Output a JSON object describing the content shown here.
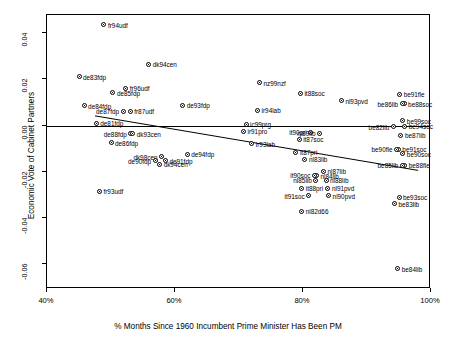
{
  "chart_data": {
    "type": "scatter",
    "title": "",
    "xlabel": "% Months Since 1960 Incumbent Prime Minister Has Been PM",
    "ylabel": "Economic Vote of Cabinet Partners",
    "xlim": [
      40,
      100
    ],
    "ylim": [
      -0.071,
      0.048
    ],
    "xticks": [
      "40%",
      "60%",
      "80%",
      "100%"
    ],
    "xtick_values": [
      40,
      60,
      80,
      100
    ],
    "yticks": [
      "0.04",
      "0.02",
      "0.00",
      "-0.02",
      "-0.04",
      "-0.06"
    ],
    "ytick_values": [
      0.04,
      0.02,
      0.0,
      -0.02,
      -0.04,
      -0.06
    ],
    "grid": false,
    "legend": null,
    "zero_line": 0.0,
    "regression_line": {
      "x0": 47.5,
      "y0": 0.0042,
      "x1": 98.0,
      "y1": -0.0195
    },
    "points": [
      {
        "label": "fr94udf",
        "x": 48.9,
        "y": 0.0437,
        "side": "right"
      },
      {
        "label": "dk94cen",
        "x": 55.9,
        "y": 0.0267,
        "side": "right"
      },
      {
        "label": "de83fdp",
        "x": 45.0,
        "y": 0.0211,
        "side": "right"
      },
      {
        "label": "nz99nzf",
        "x": 73.2,
        "y": 0.0186,
        "side": "right"
      },
      {
        "label": "fr96udf",
        "x": 52.3,
        "y": 0.0161,
        "side": "right"
      },
      {
        "label": "de85fdp",
        "x": 50.3,
        "y": 0.0143,
        "side": "right"
      },
      {
        "label": "it88soc",
        "x": 79.6,
        "y": 0.014,
        "side": "right"
      },
      {
        "label": "be91fle",
        "x": 95.1,
        "y": 0.0135,
        "side": "right"
      },
      {
        "label": "nl93pvd",
        "x": 86.0,
        "y": 0.0107,
        "side": "right"
      },
      {
        "label": "be88soc",
        "x": 95.8,
        "y": 0.0094,
        "side": "right"
      },
      {
        "label": "be86lib",
        "x": 95.5,
        "y": 0.0094,
        "side": "left"
      },
      {
        "label": "de84fdp",
        "x": 45.8,
        "y": 0.0086,
        "side": "right"
      },
      {
        "label": "de93fdp",
        "x": 61.2,
        "y": 0.0088,
        "side": "right"
      },
      {
        "label": "ir94lab",
        "x": 72.9,
        "y": 0.0066,
        "side": "right"
      },
      {
        "label": "fr87udf",
        "x": 53.0,
        "y": 0.0061,
        "side": "right"
      },
      {
        "label": "de87fdp",
        "x": 51.9,
        "y": 0.0061,
        "side": "left"
      },
      {
        "label": "be99soc",
        "x": 95.6,
        "y": 0.0021,
        "side": "right"
      },
      {
        "label": "de81fdp",
        "x": 47.7,
        "y": 0.0009,
        "side": "right"
      },
      {
        "label": "ic99prg",
        "x": 71.1,
        "y": 0.0005,
        "side": "right"
      },
      {
        "label": "be94soc",
        "x": 95.9,
        "y": -0.0003,
        "side": "right"
      },
      {
        "label": "be82lib",
        "x": 94.1,
        "y": -0.0005,
        "side": "left"
      },
      {
        "label": "ir91pro",
        "x": 70.7,
        "y": -0.0025,
        "side": "right"
      },
      {
        "label": "it90pri",
        "x": 81.2,
        "y": -0.0029,
        "side": "left"
      },
      {
        "label": "nl89lib",
        "x": 82.6,
        "y": -0.0034,
        "side": "left"
      },
      {
        "label": "de88fdp",
        "x": 53.1,
        "y": -0.0036,
        "side": "left"
      },
      {
        "label": "dk93cen",
        "x": 53.4,
        "y": -0.0036,
        "side": "right"
      },
      {
        "label": "be87lib",
        "x": 95.3,
        "y": -0.0043,
        "side": "right"
      },
      {
        "label": "it87soc",
        "x": 79.4,
        "y": -0.006,
        "side": "right"
      },
      {
        "label": "de86fdp",
        "x": 50.0,
        "y": -0.0074,
        "side": "right"
      },
      {
        "label": "ir93lab",
        "x": 72.0,
        "y": -0.008,
        "side": "right"
      },
      {
        "label": "be91soc",
        "x": 94.9,
        "y": -0.0104,
        "side": "right"
      },
      {
        "label": "be90fle",
        "x": 94.6,
        "y": -0.0104,
        "side": "left"
      },
      {
        "label": "it87pri",
        "x": 78.9,
        "y": -0.0117,
        "side": "right"
      },
      {
        "label": "be90soc",
        "x": 95.6,
        "y": -0.0122,
        "side": "right"
      },
      {
        "label": "de94fdp",
        "x": 61.9,
        "y": -0.0125,
        "side": "right"
      },
      {
        "label": "dk98cen",
        "x": 57.9,
        "y": -0.0136,
        "side": "left"
      },
      {
        "label": "nl83lib",
        "x": 80.3,
        "y": -0.0147,
        "side": "right"
      },
      {
        "label": "de91fdp",
        "x": 58.5,
        "y": -0.0153,
        "side": "right"
      },
      {
        "label": "de90fdp",
        "x": 56.9,
        "y": -0.0153,
        "side": "left"
      },
      {
        "label": "be88fle",
        "x": 95.9,
        "y": -0.0173,
        "side": "right"
      },
      {
        "label": "be85lib",
        "x": 95.5,
        "y": -0.0173,
        "side": "left"
      },
      {
        "label": "dk94cen",
        "x": 57.6,
        "y": -0.0168,
        "side": "right"
      },
      {
        "label": "nl87lib",
        "x": 83.2,
        "y": -0.0199,
        "side": "right"
      },
      {
        "label": "nl84lib",
        "x": 82.1,
        "y": -0.0219,
        "side": "right"
      },
      {
        "label": "it90soc",
        "x": 81.8,
        "y": -0.0215,
        "side": "left"
      },
      {
        "label": "nl85lib",
        "x": 82.0,
        "y": -0.0238,
        "side": "left"
      },
      {
        "label": "nl88lib",
        "x": 83.6,
        "y": -0.0238,
        "side": "right"
      },
      {
        "label": "it88pri",
        "x": 79.8,
        "y": -0.0272,
        "side": "right"
      },
      {
        "label": "nl91pvd",
        "x": 83.9,
        "y": -0.0272,
        "side": "right"
      },
      {
        "label": "fr93udf",
        "x": 48.2,
        "y": -0.0286,
        "side": "right"
      },
      {
        "label": "it91soc",
        "x": 80.9,
        "y": -0.0306,
        "side": "left"
      },
      {
        "label": "nl90pvd",
        "x": 84.0,
        "y": -0.0306,
        "side": "right"
      },
      {
        "label": "be93soc",
        "x": 95.0,
        "y": -0.0311,
        "side": "right"
      },
      {
        "label": "be83lib",
        "x": 94.3,
        "y": -0.0339,
        "side": "right"
      },
      {
        "label": "nl82d66",
        "x": 79.8,
        "y": -0.0372,
        "side": "right"
      },
      {
        "label": "be84lib",
        "x": 94.8,
        "y": -0.0621,
        "side": "right"
      }
    ]
  }
}
